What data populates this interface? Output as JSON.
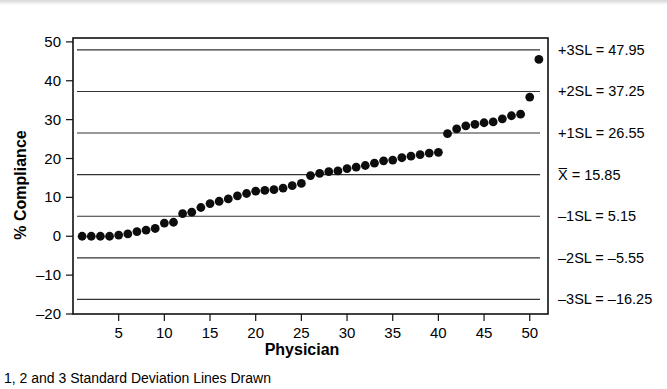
{
  "chart_data": {
    "type": "scatter",
    "title": "",
    "xlabel": "Physician",
    "ylabel": "% Compliance",
    "caption": "1, 2 and 3 Standard Deviation Lines Drawn",
    "xlim": [
      0,
      52
    ],
    "ylim": [
      -20,
      51
    ],
    "grid": false,
    "legend_position": "right-annotations",
    "x_ticks": [
      5,
      10,
      15,
      20,
      25,
      30,
      35,
      40,
      45,
      50
    ],
    "y_ticks": [
      -20,
      -10,
      0,
      10,
      20,
      30,
      40,
      50
    ],
    "series": [
      {
        "name": "% Compliance by Physician",
        "marker": "filled-circle",
        "color": "#0d0d0d",
        "x": [
          1,
          2,
          3,
          4,
          5,
          6,
          7,
          8,
          9,
          10,
          11,
          12,
          13,
          14,
          15,
          16,
          17,
          18,
          19,
          20,
          21,
          22,
          23,
          24,
          25,
          26,
          27,
          28,
          29,
          30,
          31,
          32,
          33,
          34,
          35,
          36,
          37,
          38,
          39,
          40,
          41,
          42,
          43,
          44,
          45,
          46,
          47,
          48,
          49,
          50,
          51
        ],
        "values": [
          0,
          0,
          0,
          0,
          0.3,
          0.6,
          1.2,
          1.6,
          2.0,
          3.4,
          3.6,
          5.8,
          6.2,
          7.4,
          8.4,
          9.0,
          9.6,
          10.4,
          11.0,
          11.6,
          11.8,
          12.0,
          12.4,
          13.0,
          13.6,
          15.6,
          16.2,
          16.6,
          16.8,
          17.4,
          17.8,
          18.2,
          18.8,
          19.4,
          19.6,
          20.2,
          20.6,
          21.0,
          21.4,
          21.6,
          26.4,
          27.6,
          28.4,
          28.8,
          29.2,
          29.4,
          30.2,
          31.0,
          31.4,
          35.8,
          45.5
        ]
      }
    ],
    "reference_lines": [
      {
        "id": "plus3sl",
        "label": "+3SL = 47.95",
        "value": 47.95
      },
      {
        "id": "plus2sl",
        "label": "+2SL = 37.25",
        "value": 37.25
      },
      {
        "id": "plus1sl",
        "label": "+1SL = 26.55",
        "value": 26.55
      },
      {
        "id": "centerline",
        "label": "X̅ = 15.85",
        "value": 15.85
      },
      {
        "id": "minus1sl",
        "label": "–1SL = 5.15",
        "value": 5.15
      },
      {
        "id": "minus2sl",
        "label": "–2SL = –5.55",
        "value": -5.55
      },
      {
        "id": "minus3sl",
        "label": "–3SL = –16.25",
        "value": -16.25
      }
    ]
  }
}
